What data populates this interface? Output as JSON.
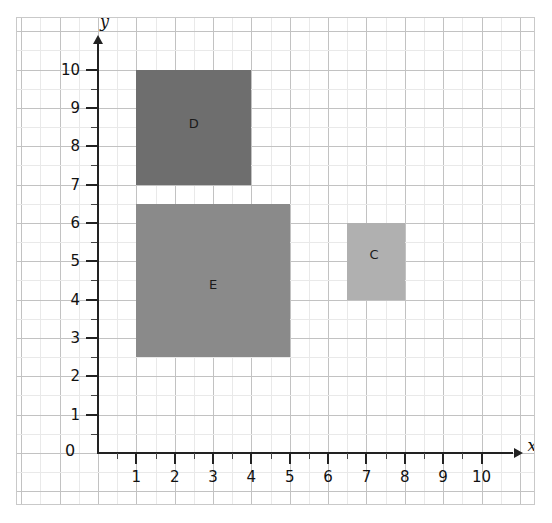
{
  "figure": {
    "kind": "coordinate-grid",
    "background_color": "#ffffff",
    "frame_color": "#c9c9c9",
    "grid_minor_color": "#e9e9e9",
    "grid_major_color": "#c2c2c2",
    "axis_color": "#222222",
    "origin_label": "0"
  },
  "axes": {
    "x": {
      "name": "x",
      "min": 0,
      "max": 10,
      "tick_labels": [
        "1",
        "2",
        "3",
        "4",
        "5",
        "6",
        "7",
        "8",
        "9",
        "10"
      ],
      "tick_values": [
        1,
        2,
        3,
        4,
        5,
        6,
        7,
        8,
        9,
        10
      ],
      "minor_step": 0.5,
      "has_arrow": true
    },
    "y": {
      "name": "y",
      "min": 0,
      "max": 10,
      "tick_labels": [
        "1",
        "2",
        "3",
        "4",
        "5",
        "6",
        "7",
        "8",
        "9",
        "10"
      ],
      "tick_values": [
        1,
        2,
        3,
        4,
        5,
        6,
        7,
        8,
        9,
        10
      ],
      "minor_step": 0.5,
      "has_arrow": true
    }
  },
  "chart_data": {
    "type": "scatter",
    "title": "",
    "xlabel": "x",
    "ylabel": "y",
    "xlim": [
      0,
      10
    ],
    "ylim": [
      0,
      10
    ],
    "grid": true,
    "legend": "none",
    "shapes": [
      {
        "label": "D",
        "shape": "rectangle",
        "x0": 1,
        "y0": 7,
        "x1": 4,
        "y1": 10,
        "width": 3,
        "height": 3,
        "color": "#6e6e6e",
        "label_x": 2.5,
        "label_y": 8.6
      },
      {
        "label": "E",
        "shape": "rectangle",
        "x0": 1,
        "y0": 2.5,
        "x1": 5,
        "y1": 6.5,
        "width": 4,
        "height": 4,
        "color": "#8a8a8a",
        "label_x": 3,
        "label_y": 4.4
      },
      {
        "label": "C",
        "shape": "rectangle",
        "x0": 6.5,
        "y0": 4,
        "x1": 8,
        "y1": 6,
        "width": 1.5,
        "height": 2,
        "color": "#b0b0b0",
        "label_x": 7.2,
        "label_y": 5.2
      }
    ]
  }
}
